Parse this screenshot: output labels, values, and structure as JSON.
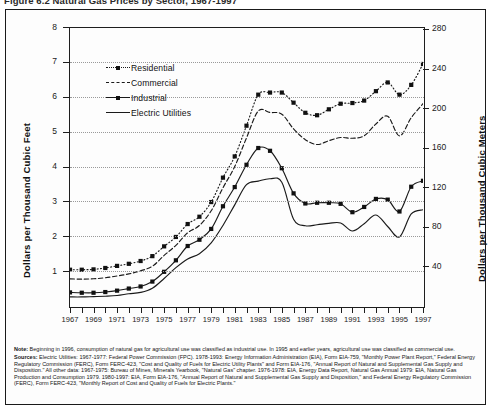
{
  "title": "Figure 6.2  Natural Gas Prices by Sector, 1967-1997",
  "axes": {
    "left_title": "Dollars per Thousand Cubic Feet",
    "right_title": "Dollars per Thousand Cubic Meters",
    "left_ticks": [
      1,
      2,
      3,
      4,
      5,
      6,
      7,
      8
    ],
    "right_ticks": [
      40,
      80,
      120,
      160,
      200,
      240,
      280
    ],
    "x_ticks": [
      1967,
      1969,
      1971,
      1973,
      1975,
      1977,
      1979,
      1981,
      1983,
      1985,
      1987,
      1989,
      1991,
      1993,
      1995,
      1997
    ]
  },
  "legend": {
    "position": "inside-top-left",
    "items": [
      {
        "label": "Residential",
        "style": "dotted-marker",
        "color": "#1a1a1a"
      },
      {
        "label": "Commercial",
        "style": "dashed",
        "color": "#1a1a1a"
      },
      {
        "label": "Industrial",
        "style": "solid-marker",
        "color": "#1a1a1a"
      },
      {
        "label": "Electric Utilities",
        "style": "solid",
        "color": "#1a1a1a"
      }
    ]
  },
  "notes": {
    "note_lead": "Note:",
    "note_text": " Beginning in 1996, consumption of natural gas for agricultural use was classified as industrial use. In 1995 and earlier years, agricultural use was classified as commercial use.",
    "sources_lead": "Sources:",
    "sources_text": " Electric Utilities: 1967-1977: Federal Power Commission (FPC). 1978-1993: Energy Information Administration (EIA), Form EIA-759, \"Monthly Power Plant Report,\" Federal Energy Regulatory Commission (FERC), Form FERC-423, \"Cost and Quality of Fuels for Electric Utility Plants\" and Form EIA-176, \"Annual Report of Natural and Supplemental Gas Supply and Disposition.\"  All other data: 1967-1975: Bureau of Mines, Minerals Yearbook, \"Natural Gas\" chapter.  1976-1978: EIA, Energy Data Report, Natural Gas Annual 1979: EIA, Natural Gas Production and Consumption 1979.  1980-1997: EIA, Form EIA-176, \"Annual Report of Natural and Supplemental Gas Supply and Disposition,\" and Federal Energy Regulatory Commission (FERC), Form FERC-423, \"Monthly Report of Cost and Quality of Fuels for Electric Plants.\""
  },
  "chart_data": {
    "type": "line",
    "title": "Natural Gas Prices by Sector, 1967-1997",
    "xlabel": "",
    "ylabel": "Dollars per Thousand Cubic Feet",
    "ylabel_right": "Dollars per Thousand Cubic Meters",
    "xlim": [
      1967,
      1997
    ],
    "ylim": [
      0,
      8
    ],
    "ylim_right": [
      0,
      282
    ],
    "grid": true,
    "x": [
      1967,
      1968,
      1969,
      1970,
      1971,
      1972,
      1973,
      1974,
      1975,
      1976,
      1977,
      1978,
      1979,
      1980,
      1981,
      1982,
      1983,
      1984,
      1985,
      1986,
      1987,
      1988,
      1989,
      1990,
      1991,
      1992,
      1993,
      1994,
      1995,
      1996,
      1997
    ],
    "series": [
      {
        "name": "Residential",
        "style": "dotted-marker",
        "values": [
          1.04,
          1.04,
          1.05,
          1.09,
          1.15,
          1.21,
          1.29,
          1.43,
          1.71,
          1.98,
          2.35,
          2.56,
          2.98,
          3.68,
          4.29,
          5.17,
          6.06,
          6.12,
          6.12,
          5.83,
          5.54,
          5.47,
          5.64,
          5.8,
          5.82,
          5.89,
          6.16,
          6.41,
          6.06,
          6.34,
          6.94
        ],
        "marker": "square"
      },
      {
        "name": "Commercial",
        "style": "dashed",
        "values": [
          0.78,
          0.77,
          0.78,
          0.81,
          0.86,
          0.92,
          1.01,
          1.14,
          1.45,
          1.74,
          2.1,
          2.31,
          2.73,
          3.39,
          4.0,
          4.82,
          5.59,
          5.55,
          5.5,
          5.08,
          4.77,
          4.63,
          4.74,
          4.83,
          4.81,
          4.88,
          5.22,
          5.44,
          4.88,
          5.4,
          5.8
        ],
        "marker": "none"
      },
      {
        "name": "Industrial",
        "style": "solid-marker",
        "values": [
          0.39,
          0.38,
          0.38,
          0.4,
          0.44,
          0.5,
          0.56,
          0.7,
          0.98,
          1.31,
          1.72,
          1.9,
          2.21,
          2.86,
          3.41,
          4.05,
          4.53,
          4.45,
          3.95,
          3.23,
          2.94,
          2.96,
          2.96,
          2.93,
          2.69,
          2.84,
          3.07,
          3.05,
          2.71,
          3.42,
          3.59
        ],
        "marker": "square"
      },
      {
        "name": "Electric Utilities",
        "style": "solid",
        "values": [
          0.26,
          0.26,
          0.27,
          0.28,
          0.3,
          0.35,
          0.39,
          0.51,
          0.79,
          1.1,
          1.35,
          1.5,
          1.81,
          2.31,
          2.9,
          3.48,
          3.58,
          3.65,
          3.55,
          2.49,
          2.3,
          2.33,
          2.37,
          2.38,
          2.15,
          2.36,
          2.61,
          2.28,
          1.98,
          2.64,
          2.76
        ],
        "marker": "none"
      }
    ]
  }
}
